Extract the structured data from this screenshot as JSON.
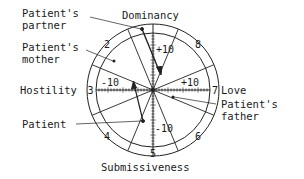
{
  "diagram": {
    "axes": {
      "top": "Dominancy",
      "bottom": "Submissiveness",
      "left": "Hostility",
      "right": "Love"
    },
    "scale_labels": {
      "up": "+10",
      "down": "-10",
      "left": "-10",
      "right": "+10"
    },
    "segments": [
      "2",
      "3",
      "4",
      "5",
      "6",
      "7",
      "8"
    ],
    "annotations": {
      "partner": [
        "Patient's",
        "partner"
      ],
      "mother": [
        "Patient's",
        "mother"
      ],
      "patient": "Patient",
      "father": [
        "Patient's",
        "father"
      ]
    },
    "colors": {
      "ink": "#222222",
      "background": "#ffffff"
    }
  }
}
